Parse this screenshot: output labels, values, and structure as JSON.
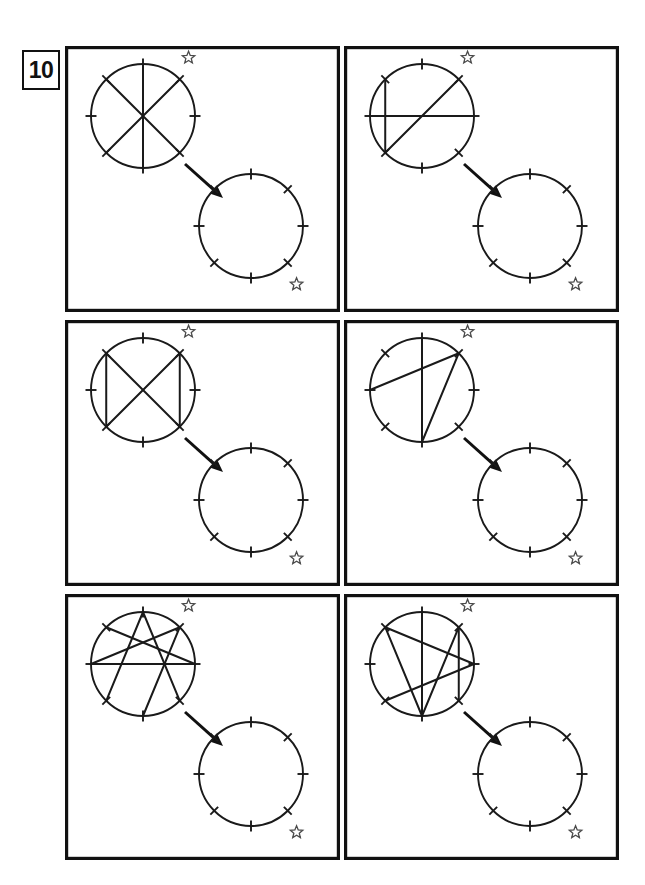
{
  "worksheet": {
    "exercise_number": "10",
    "title": "Rotational symmetry pattern copying exercise",
    "instruction_implied": "Copy each chord pattern into the blank circle, matching the star reference mark",
    "page_background": "#ffffff",
    "ink_color": "#1a1a1a",
    "frame_color": "#111111",
    "star_color": "#4a4a4a"
  },
  "layout": {
    "columns": 2,
    "rows": 3,
    "panel_width": 275,
    "panel_height": 266,
    "panel_gap_x": 4,
    "panel_gap_y": 8,
    "grid_left": 65,
    "grid_top": 46
  },
  "geometry": {
    "source_circle": {
      "cx": 78,
      "cy": 70,
      "r": 52,
      "tick_count": 8,
      "tick_angles_deg": [
        0,
        45,
        90,
        135,
        180,
        225,
        270,
        315
      ],
      "tick_length": 11,
      "star": {
        "angle_deg": 52,
        "offset": 22,
        "size": 13
      }
    },
    "target_circle": {
      "cx": 186,
      "cy": 180,
      "r": 52,
      "tick_count": 8,
      "tick_angles_deg": [
        0,
        45,
        90,
        135,
        180,
        225,
        270,
        315
      ],
      "tick_length": 11,
      "star": {
        "angle_deg": -52,
        "offset": 22,
        "size": 13
      }
    },
    "arrow": {
      "x1": 120,
      "y1": 118,
      "x2": 158,
      "y2": 152,
      "head_size": 13
    }
  },
  "panels": [
    {
      "id": "panel-1",
      "index": 1,
      "position": "top-left",
      "chord_count": 3,
      "description": "Three diameters forming a six-spoke asterisk",
      "chords": [
        {
          "from_deg": 90,
          "to_deg": 270
        },
        {
          "from_deg": 45,
          "to_deg": 225
        },
        {
          "from_deg": 135,
          "to_deg": 315
        }
      ]
    },
    {
      "id": "panel-2",
      "index": 2,
      "position": "top-right",
      "chord_count": 3,
      "description": "Horizontal diameter, left vertical chord, and one long diagonal",
      "chords": [
        {
          "from_deg": 0,
          "to_deg": 180
        },
        {
          "from_deg": 135,
          "to_deg": 225
        },
        {
          "from_deg": 225,
          "to_deg": 45
        }
      ]
    },
    {
      "id": "panel-3",
      "index": 3,
      "position": "middle-left",
      "chord_count": 4,
      "description": "Crossing diagonals with two vertical side chords",
      "chords": [
        {
          "from_deg": 135,
          "to_deg": 315
        },
        {
          "from_deg": 45,
          "to_deg": 225
        },
        {
          "from_deg": 135,
          "to_deg": 225
        },
        {
          "from_deg": 45,
          "to_deg": 315
        }
      ]
    },
    {
      "id": "panel-4",
      "index": 4,
      "position": "middle-right",
      "chord_count": 3,
      "description": "Vertical diameter with a triangle attached at the upper-right tick",
      "chords": [
        {
          "from_deg": 90,
          "to_deg": 270
        },
        {
          "from_deg": 180,
          "to_deg": 45
        },
        {
          "from_deg": 270,
          "to_deg": 45
        }
      ]
    },
    {
      "id": "panel-5",
      "index": 5,
      "position": "bottom-left",
      "chord_count": 6,
      "description": "Dense star-burst of six crossing chords with a horizontal diameter",
      "chords": [
        {
          "from_deg": 0,
          "to_deg": 180
        },
        {
          "from_deg": 90,
          "to_deg": 225
        },
        {
          "from_deg": 90,
          "to_deg": 315
        },
        {
          "from_deg": 135,
          "to_deg": 0
        },
        {
          "from_deg": 45,
          "to_deg": 270
        },
        {
          "from_deg": 180,
          "to_deg": 45
        }
      ]
    },
    {
      "id": "panel-6",
      "index": 6,
      "position": "bottom-right",
      "chord_count": 6,
      "description": "Vertical diameter with a five-pointed star weave of chords",
      "chords": [
        {
          "from_deg": 90,
          "to_deg": 270
        },
        {
          "from_deg": 135,
          "to_deg": 270
        },
        {
          "from_deg": 135,
          "to_deg": 0
        },
        {
          "from_deg": 45,
          "to_deg": 270
        },
        {
          "from_deg": 45,
          "to_deg": 315
        },
        {
          "from_deg": 225,
          "to_deg": 0
        }
      ]
    }
  ]
}
